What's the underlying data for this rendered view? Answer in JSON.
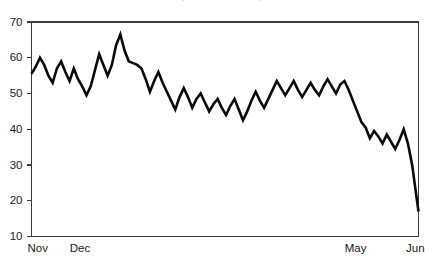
{
  "chart_data": {
    "type": "line",
    "title": "Analysts from Forecasting...",
    "xlabel": "",
    "ylabel": "",
    "ylim": [
      10,
      70
    ],
    "yticks": [
      10,
      20,
      30,
      40,
      50,
      60,
      70
    ],
    "ytick_labels": [
      "10",
      "20",
      "30",
      "40",
      "50",
      "60",
      "70"
    ],
    "xtick_positions": [
      0,
      20,
      150,
      183
    ],
    "xtick_labels": [
      "Nov",
      "Dec",
      "May",
      "Jun"
    ],
    "grid": false,
    "legend": null,
    "series": [
      {
        "name": "value",
        "color": "#0a0a0a",
        "x": [
          0,
          2,
          4,
          6,
          8,
          10,
          12,
          14,
          16,
          18,
          20,
          22,
          24,
          26,
          28,
          30,
          32,
          34,
          36,
          38,
          40,
          42,
          44,
          46,
          48,
          50,
          52,
          54,
          56,
          58,
          60,
          62,
          64,
          66,
          68,
          70,
          72,
          74,
          76,
          78,
          80,
          82,
          84,
          86,
          88,
          90,
          92,
          94,
          96,
          98,
          100,
          102,
          104,
          106,
          108,
          110,
          112,
          114,
          116,
          118,
          120,
          122,
          124,
          126,
          128,
          130,
          132,
          134,
          136,
          138,
          140,
          142,
          144,
          146,
          148,
          150,
          152,
          154,
          156,
          158,
          160,
          162,
          164,
          166,
          168,
          170,
          172,
          174,
          176,
          178,
          180,
          183
        ],
        "values": [
          55.5,
          57.5,
          60.0,
          58.0,
          55.0,
          53.0,
          57.0,
          59.0,
          56.0,
          53.5,
          57.0,
          54.0,
          52.0,
          49.5,
          52.0,
          56.5,
          61.0,
          58.0,
          55.0,
          58.0,
          63.5,
          66.5,
          62.0,
          59.0,
          58.5,
          58.0,
          57.0,
          54.0,
          50.5,
          53.5,
          56.0,
          53.0,
          50.5,
          48.0,
          45.5,
          49.0,
          51.5,
          49.0,
          46.0,
          48.5,
          50.0,
          47.5,
          45.0,
          47.0,
          48.5,
          46.0,
          44.0,
          46.5,
          48.5,
          45.5,
          42.5,
          45.0,
          48.0,
          50.5,
          48.0,
          46.0,
          48.5,
          51.0,
          53.5,
          51.5,
          49.5,
          51.5,
          53.5,
          51.0,
          49.0,
          51.0,
          53.0,
          51.0,
          49.5,
          52.0,
          54.0,
          52.0,
          50.0,
          52.5,
          53.5,
          51.0,
          48.0,
          45.0,
          42.0,
          40.5,
          37.5,
          39.5,
          38.0,
          36.0,
          38.5,
          36.5,
          34.5,
          37.0,
          40.0,
          36.0,
          30.0,
          17.0
        ]
      }
    ]
  }
}
